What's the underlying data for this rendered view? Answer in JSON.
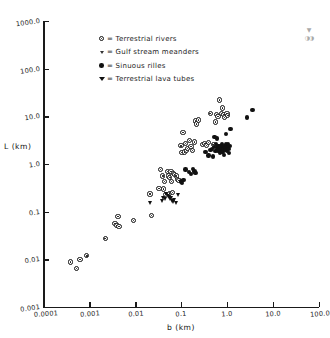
{
  "chart_data": {
    "type": "scatter",
    "title": "",
    "xlabel": "b (km)",
    "ylabel": "L (km)",
    "xscale": "log",
    "yscale": "log",
    "xlim": [
      0.0001,
      100.0
    ],
    "ylim": [
      0.001,
      1000.0
    ],
    "grid": false,
    "legend_position": "upper-left-inside",
    "x_ticks": [
      "0.0001",
      "0.001",
      "0.01",
      "0.1",
      "1.0",
      "10.0",
      "100.0"
    ],
    "x_tick_values": [
      0.0001,
      0.001,
      0.01,
      0.1,
      1.0,
      10.0,
      100.0
    ],
    "y_ticks": [
      "0.001",
      "0.01",
      "0.1",
      "1.0",
      "10.0",
      "100.0",
      "1000.0"
    ],
    "y_tick_values": [
      0.001,
      0.01,
      0.1,
      1.0,
      10.0,
      100.0,
      1000.0
    ],
    "legend": [
      {
        "marker": "open-circle-dot",
        "symbol": "o",
        "label": "= Terrestrial rivers"
      },
      {
        "marker": "open-vee",
        "symbol": "v",
        "label": "= Gulf stream meanders"
      },
      {
        "marker": "filled-circle",
        "symbol": "●",
        "label": "= Sinuous rilles"
      },
      {
        "marker": "filled-triangle-down",
        "symbol": "▼",
        "label": "= Terrestrial lava tubes"
      }
    ],
    "series": [
      {
        "name": "Terrestrial rivers",
        "marker": "open-circle-dot",
        "points": [
          [
            0.00039,
            0.0088
          ],
          [
            0.00052,
            0.0064
          ],
          [
            0.00062,
            0.01
          ],
          [
            0.00088,
            0.0118
          ],
          [
            0.0022,
            0.0272
          ],
          [
            0.0036,
            0.057
          ],
          [
            0.004,
            0.052
          ],
          [
            0.0042,
            0.08
          ],
          [
            0.0044,
            0.0495
          ],
          [
            0.0093,
            0.066
          ],
          [
            0.021,
            0.235
          ],
          [
            0.0225,
            0.084
          ],
          [
            0.033,
            0.31
          ],
          [
            0.036,
            0.76
          ],
          [
            0.04,
            0.56
          ],
          [
            0.042,
            0.3
          ],
          [
            0.044,
            0.43
          ],
          [
            0.046,
            0.23
          ],
          [
            0.05,
            0.7
          ],
          [
            0.053,
            0.56
          ],
          [
            0.056,
            0.245
          ],
          [
            0.057,
            0.52
          ],
          [
            0.06,
            0.69
          ],
          [
            0.062,
            0.43
          ],
          [
            0.064,
            0.25
          ],
          [
            0.068,
            0.64
          ],
          [
            0.072,
            0.61
          ],
          [
            0.078,
            0.56
          ],
          [
            0.085,
            0.47
          ],
          [
            0.09,
            0.455
          ],
          [
            0.1,
            2.4
          ],
          [
            0.105,
            1.75
          ],
          [
            0.11,
            4.6
          ],
          [
            0.118,
            1.78
          ],
          [
            0.125,
            2.65
          ],
          [
            0.13,
            1.9
          ],
          [
            0.14,
            2.1
          ],
          [
            0.15,
            3.1
          ],
          [
            0.165,
            2.3
          ],
          [
            0.175,
            1.95
          ],
          [
            0.195,
            2.9
          ],
          [
            0.205,
            8.0
          ],
          [
            0.215,
            6.9
          ],
          [
            0.24,
            8.4
          ],
          [
            0.29,
            2.55
          ],
          [
            0.33,
            2.7
          ],
          [
            0.36,
            2.45
          ],
          [
            0.4,
            2.8
          ],
          [
            0.43,
            11.5
          ],
          [
            0.5,
            2.6
          ],
          [
            0.56,
            7.6
          ],
          [
            0.6,
            11.0
          ],
          [
            0.64,
            10.0
          ],
          [
            0.7,
            22.0
          ],
          [
            0.76,
            11.5
          ],
          [
            0.8,
            15.0
          ],
          [
            0.86,
            11.0
          ],
          [
            0.9,
            9.5
          ],
          [
            1.0,
            11.5
          ],
          [
            1.05,
            10.5
          ]
        ]
      },
      {
        "name": "Sinuous rilles",
        "marker": "filled-circle",
        "points": [
          [
            0.125,
            0.76
          ],
          [
            0.15,
            0.68
          ],
          [
            0.165,
            0.61
          ],
          [
            0.18,
            0.79
          ],
          [
            0.195,
            0.7
          ],
          [
            0.1,
            0.43
          ],
          [
            0.105,
            0.4
          ],
          [
            0.112,
            0.455
          ],
          [
            0.205,
            0.64
          ],
          [
            0.34,
            1.8
          ],
          [
            0.4,
            1.5
          ],
          [
            0.44,
            1.95
          ],
          [
            0.47,
            2.05
          ],
          [
            0.5,
            1.45
          ],
          [
            0.53,
            2.3
          ],
          [
            0.56,
            1.85
          ],
          [
            0.58,
            2.6
          ],
          [
            0.6,
            1.95
          ],
          [
            0.62,
            2.2
          ],
          [
            0.65,
            1.9
          ],
          [
            0.66,
            2.4
          ],
          [
            0.68,
            2.05
          ],
          [
            0.7,
            1.7
          ],
          [
            0.71,
            2.15
          ],
          [
            0.73,
            2.35
          ],
          [
            0.75,
            1.95
          ],
          [
            0.77,
            2.6
          ],
          [
            0.79,
            2.1
          ],
          [
            0.8,
            1.8
          ],
          [
            0.82,
            2.25
          ],
          [
            0.84,
            2.05
          ],
          [
            0.86,
            1.55
          ],
          [
            0.88,
            2.4
          ],
          [
            0.9,
            2.15
          ],
          [
            0.93,
            1.95
          ],
          [
            0.96,
            2.55
          ],
          [
            0.99,
            1.85
          ],
          [
            1.02,
            2.3
          ],
          [
            1.05,
            2.6
          ],
          [
            1.08,
            2.05
          ],
          [
            1.1,
            1.7
          ],
          [
            1.15,
            2.4
          ],
          [
            1.2,
            5.4
          ],
          [
            0.95,
            4.2
          ],
          [
            0.54,
            3.7
          ],
          [
            2.7,
            9.4
          ],
          [
            3.6,
            13.5
          ],
          [
            0.6,
            3.4
          ]
        ]
      },
      {
        "name": "Terrestrial lava tubes",
        "marker": "filled-triangle-down",
        "points": [
          [
            0.0215,
            0.155
          ],
          [
            0.04,
            0.17
          ],
          [
            0.042,
            0.19
          ],
          [
            0.046,
            0.188
          ],
          [
            0.05,
            0.235
          ],
          [
            0.053,
            0.215
          ],
          [
            0.056,
            0.205
          ],
          [
            0.06,
            0.18
          ],
          [
            0.063,
            0.195
          ],
          [
            0.066,
            0.17
          ],
          [
            0.07,
            0.16
          ],
          [
            0.074,
            0.175
          ],
          [
            0.082,
            0.15
          ],
          [
            0.091,
            0.225
          ]
        ]
      },
      {
        "name": "Gulf stream meanders",
        "marker": "open-vee",
        "points": []
      }
    ]
  },
  "corner_stamp": {
    "line1": "▼",
    "line2": "◑◑"
  }
}
